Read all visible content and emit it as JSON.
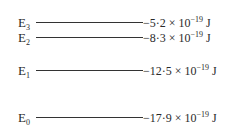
{
  "diagram": {
    "type": "energy-level-diagram",
    "levels": [
      {
        "name": "E",
        "sub": "3",
        "mantissa": "−5·2",
        "times": " × 10",
        "exp": "−19",
        "unit": " J",
        "value_e19": -5.2
      },
      {
        "name": "E",
        "sub": "2",
        "mantissa": "−8·3",
        "times": " × 10",
        "exp": "−19",
        "unit": " J",
        "value_e19": -8.3
      },
      {
        "name": "E",
        "sub": "1",
        "mantissa": "−12·5",
        "times": " × 10",
        "exp": "−19",
        "unit": " J",
        "value_e19": -12.5
      },
      {
        "name": "E",
        "sub": "0",
        "mantissa": "−17·9",
        "times": " × 10",
        "exp": "−19",
        "unit": " J",
        "value_e19": -17.9
      }
    ]
  }
}
